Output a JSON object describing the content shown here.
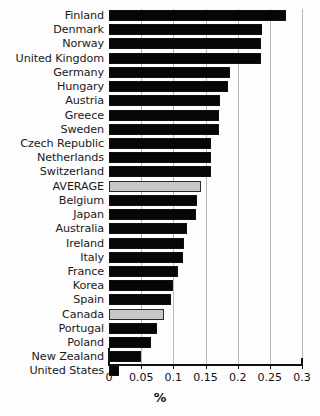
{
  "chart_data": {
    "type": "bar",
    "orientation": "horizontal",
    "title": "",
    "xlabel": "%",
    "ylabel": "",
    "xlim": [
      0,
      0.3
    ],
    "xticks": [
      "0",
      "0.05",
      "0.1",
      "0.15",
      "0.2",
      "0.25",
      "0.3"
    ],
    "xtick_values": [
      0,
      0.05,
      0.1,
      0.15,
      0.2,
      0.25,
      0.3
    ],
    "grid": true,
    "grid_axis": "x",
    "legend": false,
    "colors": {
      "bar": "#060606",
      "highlight_bar": "#c6c6c6",
      "gridline": "#b9b9b9",
      "axis": "#111111",
      "background": "#ffffff"
    },
    "categories": [
      "Finland",
      "Denmark",
      "Norway",
      "United Kingdom",
      "Germany",
      "Hungary",
      "Austria",
      "Greece",
      "Sweden",
      "Czech Republic",
      "Netherlands",
      "Switzerland",
      "AVERAGE",
      "Belgium",
      "Japan",
      "Australia",
      "Ireland",
      "Italy",
      "France",
      "Korea",
      "Spain",
      "Canada",
      "Portugal",
      "Poland",
      "New Zealand",
      "United States"
    ],
    "values": [
      0.275,
      0.238,
      0.236,
      0.236,
      0.188,
      0.185,
      0.172,
      0.171,
      0.171,
      0.159,
      0.158,
      0.158,
      0.143,
      0.137,
      0.136,
      0.122,
      0.116,
      0.115,
      0.108,
      0.099,
      0.096,
      0.086,
      0.075,
      0.065,
      0.049,
      0.015
    ],
    "highlighted": [
      "AVERAGE",
      "Canada"
    ]
  }
}
